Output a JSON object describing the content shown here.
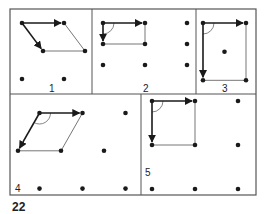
{
  "figure": {
    "number": "22",
    "colors": {
      "ink": "#1a1a1a",
      "frame": "#555555",
      "thin_line": "#666666"
    },
    "panels": [
      {
        "id": 1,
        "label": "1",
        "dots": [
          [
            0,
            0
          ],
          [
            1,
            0
          ],
          [
            0.5,
            0.667
          ],
          [
            1.5,
            0.667
          ],
          [
            0,
            1.333
          ],
          [
            1,
            1.333
          ]
        ],
        "vectors": [
          [
            [
              0,
              0
            ],
            [
              1,
              0
            ]
          ],
          [
            [
              0,
              0
            ],
            [
              0.5,
              0.667
            ]
          ]
        ],
        "thin_edges": [
          [
            [
              1,
              0
            ],
            [
              1.5,
              0.667
            ]
          ],
          [
            [
              0.5,
              0.667
            ],
            [
              1.5,
              0.667
            ]
          ]
        ],
        "angle_mark": false
      },
      {
        "id": 2,
        "label": "2",
        "dots": [
          [
            0,
            0
          ],
          [
            1,
            0
          ],
          [
            2,
            0
          ],
          [
            0,
            0.5
          ],
          [
            1,
            0.5
          ],
          [
            2,
            0.5
          ],
          [
            0,
            1
          ],
          [
            1,
            1
          ],
          [
            2,
            1
          ]
        ],
        "vectors": [
          [
            [
              0,
              0
            ],
            [
              1,
              0
            ]
          ],
          [
            [
              0,
              0
            ],
            [
              0,
              0.5
            ]
          ]
        ],
        "thin_edges": [
          [
            [
              1,
              0
            ],
            [
              1,
              0.5
            ]
          ],
          [
            [
              0,
              0.5
            ],
            [
              1,
              0.5
            ]
          ]
        ],
        "angle_mark": true
      },
      {
        "id": 3,
        "label": "3",
        "dots": [
          [
            0,
            0
          ],
          [
            1,
            0
          ],
          [
            0.5,
            0.667
          ],
          [
            0,
            1.333
          ],
          [
            1,
            1.333
          ]
        ],
        "vectors": [
          [
            [
              0,
              0
            ],
            [
              1,
              0
            ]
          ],
          [
            [
              0,
              0
            ],
            [
              0,
              1.333
            ]
          ]
        ],
        "thin_edges": [
          [
            [
              1,
              0
            ],
            [
              1,
              1.333
            ]
          ],
          [
            [
              0,
              1.333
            ],
            [
              1,
              1.333
            ]
          ]
        ],
        "angle_mark": true
      },
      {
        "id": 4,
        "label": "4",
        "dots": [
          [
            0.5,
            0
          ],
          [
            1.5,
            0
          ],
          [
            2.5,
            0
          ],
          [
            0,
            0.9
          ],
          [
            1,
            0.9
          ],
          [
            2,
            0.9
          ],
          [
            0.5,
            1.8
          ],
          [
            1.5,
            1.8
          ],
          [
            2.5,
            1.8
          ]
        ],
        "vectors": [
          [
            [
              0.5,
              0
            ],
            [
              1.5,
              0
            ]
          ],
          [
            [
              0.5,
              0
            ],
            [
              0,
              0.9
            ]
          ]
        ],
        "thin_edges": [
          [
            [
              1.5,
              0
            ],
            [
              1,
              0.9
            ]
          ],
          [
            [
              0,
              0.9
            ],
            [
              1,
              0.9
            ]
          ]
        ],
        "angle_mark": true
      },
      {
        "id": 5,
        "label": "5",
        "dots": [
          [
            0,
            0
          ],
          [
            1,
            0
          ],
          [
            2,
            0
          ],
          [
            0,
            1
          ],
          [
            1,
            1
          ],
          [
            2,
            1
          ],
          [
            0,
            2
          ],
          [
            1,
            2
          ],
          [
            2,
            2
          ]
        ],
        "vectors": [
          [
            [
              0,
              0
            ],
            [
              1,
              0
            ]
          ],
          [
            [
              0,
              0
            ],
            [
              0,
              1
            ]
          ]
        ],
        "thin_edges": [
          [
            [
              1,
              0
            ],
            [
              1,
              1
            ]
          ],
          [
            [
              0,
              1
            ],
            [
              1,
              1
            ]
          ]
        ],
        "angle_mark": true
      }
    ]
  }
}
